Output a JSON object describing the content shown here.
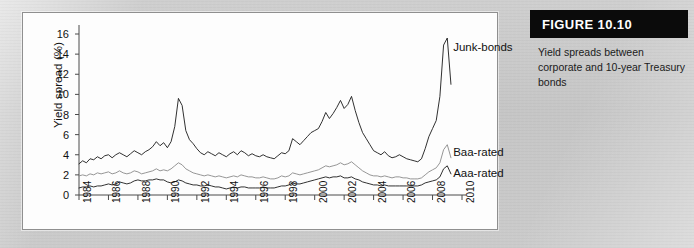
{
  "figure": {
    "header_label": "FIGURE 10.10",
    "caption": "Yield spreads between corporate and 10-year Treasury bonds"
  },
  "chart_data": {
    "type": "line",
    "title": "Yield spreads between corporate and 10-year Treasury bonds",
    "xlabel": "",
    "ylabel": "Yield spread (%)",
    "xlim": [
      1984,
      2010
    ],
    "ylim": [
      0,
      16
    ],
    "grid": false,
    "legend_position": "inline-right-annotations",
    "y_ticks": [
      0,
      2,
      4,
      6,
      8,
      10,
      12,
      14,
      16
    ],
    "x_ticks": [
      1984,
      1986,
      1988,
      1990,
      1992,
      1994,
      1996,
      1998,
      2000,
      2002,
      2004,
      2006,
      2008,
      2010
    ],
    "x_tick_labels": [
      "1984",
      "1986",
      "1988",
      "1990",
      "1992",
      "1994",
      "1996",
      "1998",
      "2000",
      "2002",
      "2004",
      "2006",
      "2008",
      "2010"
    ],
    "annotations": [
      {
        "text": "Junk-bonds",
        "series": "Junk-bonds",
        "x": 2009.4,
        "y": 14.6
      },
      {
        "text": "Baa-rated",
        "series": "Baa-rated",
        "x": 2009.4,
        "y": 4.2
      },
      {
        "text": "Aaa-rated",
        "series": "Aaa-rated",
        "x": 2009.4,
        "y": 2.1
      }
    ],
    "x": [
      1984.0,
      1984.25,
      1984.5,
      1984.75,
      1985.0,
      1985.25,
      1985.5,
      1985.75,
      1986.0,
      1986.25,
      1986.5,
      1986.75,
      1987.0,
      1987.25,
      1987.5,
      1987.75,
      1988.0,
      1988.25,
      1988.5,
      1988.75,
      1989.0,
      1989.25,
      1989.5,
      1989.75,
      1990.0,
      1990.25,
      1990.5,
      1990.75,
      1991.0,
      1991.25,
      1991.5,
      1991.75,
      1992.0,
      1992.25,
      1992.5,
      1992.75,
      1993.0,
      1993.25,
      1993.5,
      1993.75,
      1994.0,
      1994.25,
      1994.5,
      1994.75,
      1995.0,
      1995.25,
      1995.5,
      1995.75,
      1996.0,
      1996.25,
      1996.5,
      1996.75,
      1997.0,
      1997.25,
      1997.5,
      1997.75,
      1998.0,
      1998.25,
      1998.5,
      1998.75,
      1999.0,
      1999.25,
      1999.5,
      1999.75,
      2000.0,
      2000.25,
      2000.5,
      2000.75,
      2001.0,
      2001.25,
      2001.5,
      2001.75,
      2002.0,
      2002.25,
      2002.5,
      2002.75,
      2003.0,
      2003.25,
      2003.5,
      2003.75,
      2004.0,
      2004.25,
      2004.5,
      2004.75,
      2005.0,
      2005.25,
      2005.5,
      2005.75,
      2006.0,
      2006.25,
      2006.5,
      2006.75,
      2007.0,
      2007.25,
      2007.5,
      2007.75,
      2008.0,
      2008.25,
      2008.5,
      2008.75,
      2009.0,
      2009.25
    ],
    "series": [
      {
        "name": "Junk-bonds",
        "color": "#1a1a1a",
        "values": [
          3.1,
          3.4,
          3.2,
          3.6,
          3.5,
          3.8,
          3.6,
          3.9,
          4.0,
          3.7,
          4.0,
          4.2,
          4.0,
          3.8,
          4.1,
          4.4,
          4.2,
          4.0,
          4.3,
          4.5,
          4.8,
          5.3,
          4.9,
          5.2,
          4.7,
          5.3,
          6.8,
          9.6,
          8.9,
          6.4,
          5.5,
          5.1,
          4.6,
          4.2,
          4.0,
          4.3,
          4.1,
          3.9,
          4.2,
          4.0,
          3.8,
          4.1,
          4.3,
          4.0,
          4.4,
          4.2,
          3.9,
          4.1,
          3.9,
          3.8,
          4.0,
          3.8,
          3.7,
          3.6,
          3.9,
          4.2,
          4.1,
          4.4,
          5.6,
          5.3,
          5.0,
          5.4,
          5.8,
          6.2,
          6.4,
          6.6,
          7.3,
          8.2,
          7.6,
          8.1,
          8.7,
          9.4,
          8.6,
          9.0,
          9.8,
          8.4,
          7.2,
          6.2,
          5.6,
          5.0,
          4.4,
          4.2,
          4.0,
          4.3,
          3.9,
          3.7,
          3.8,
          4.0,
          3.8,
          3.6,
          3.5,
          3.4,
          3.3,
          3.6,
          4.6,
          5.8,
          6.6,
          7.4,
          9.8,
          14.9,
          15.6,
          11.0
        ]
      },
      {
        "name": "Baa-rated",
        "color": "#8a8a8a",
        "values": [
          1.9,
          2.0,
          1.9,
          2.1,
          2.0,
          2.2,
          2.1,
          2.2,
          2.3,
          2.1,
          2.2,
          2.4,
          2.2,
          2.1,
          2.2,
          2.4,
          2.3,
          2.1,
          2.2,
          2.3,
          2.4,
          2.6,
          2.4,
          2.5,
          2.4,
          2.6,
          2.9,
          3.2,
          3.0,
          2.6,
          2.4,
          2.2,
          2.1,
          2.0,
          1.9,
          2.0,
          1.9,
          1.8,
          1.9,
          1.8,
          1.7,
          1.8,
          1.9,
          1.8,
          2.0,
          1.9,
          1.8,
          1.8,
          1.7,
          1.7,
          1.8,
          1.7,
          1.6,
          1.6,
          1.7,
          1.9,
          1.8,
          1.9,
          2.2,
          2.1,
          2.0,
          2.1,
          2.2,
          2.3,
          2.4,
          2.5,
          2.7,
          2.9,
          2.8,
          2.9,
          3.0,
          3.2,
          3.0,
          3.1,
          3.3,
          3.0,
          2.7,
          2.4,
          2.2,
          2.0,
          1.9,
          1.9,
          1.8,
          1.9,
          1.8,
          1.7,
          1.8,
          1.8,
          1.7,
          1.7,
          1.6,
          1.6,
          1.6,
          1.7,
          2.0,
          2.3,
          2.5,
          2.7,
          3.2,
          4.5,
          5.0,
          3.7
        ]
      },
      {
        "name": "Aaa-rated",
        "color": "#1a1a1a",
        "values": [
          0.7,
          0.8,
          0.8,
          0.9,
          0.8,
          0.9,
          0.9,
          1.0,
          1.1,
          1.0,
          1.1,
          1.3,
          1.2,
          1.1,
          1.2,
          1.4,
          1.5,
          1.4,
          1.4,
          1.5,
          1.5,
          1.6,
          1.5,
          1.5,
          1.3,
          1.2,
          1.3,
          1.5,
          1.4,
          1.2,
          1.1,
          1.0,
          1.0,
          0.9,
          0.9,
          1.0,
          0.9,
          0.8,
          0.8,
          0.7,
          0.6,
          0.7,
          0.8,
          0.7,
          0.8,
          0.8,
          0.7,
          0.7,
          0.7,
          0.7,
          0.8,
          0.7,
          0.7,
          0.7,
          0.8,
          0.9,
          0.9,
          1.0,
          1.2,
          1.1,
          1.1,
          1.2,
          1.3,
          1.4,
          1.5,
          1.6,
          1.7,
          1.8,
          1.7,
          1.8,
          1.8,
          1.9,
          1.7,
          1.7,
          1.8,
          1.6,
          1.5,
          1.3,
          1.2,
          1.1,
          1.0,
          1.0,
          0.9,
          1.0,
          0.9,
          0.9,
          0.9,
          0.9,
          0.9,
          0.9,
          0.9,
          0.9,
          0.9,
          1.0,
          1.2,
          1.3,
          1.4,
          1.5,
          1.8,
          2.6,
          2.9,
          2.1
        ]
      }
    ]
  }
}
